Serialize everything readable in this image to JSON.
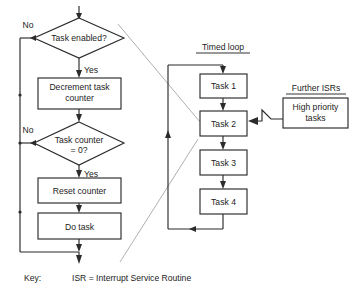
{
  "diagram": {
    "type": "flowchart",
    "colors": {
      "background": "#ffffff",
      "stroke": "#2b2b2b",
      "text": "#1c1c1c",
      "guide_line": "#9a9a9a"
    },
    "left_branch": {
      "decisions": [
        {
          "id": "task-enabled",
          "label": "Task enabled?"
        },
        {
          "id": "task-counter-zero",
          "label_line1": "Task counter",
          "label_line2": "= 0?"
        }
      ],
      "processes": [
        {
          "id": "decrement-task-counter",
          "label_line1": "Decrement task",
          "label_line2": "counter"
        },
        {
          "id": "reset-counter",
          "label": "Reset counter"
        },
        {
          "id": "do-task",
          "label": "Do task"
        }
      ],
      "edge_labels": {
        "no_1": "No",
        "yes_1": "Yes",
        "no_2": "No",
        "yes_2": "Yes"
      }
    },
    "timed_loop": {
      "title": "Timed loop",
      "tasks": [
        {
          "id": "task-1",
          "label": "Task 1"
        },
        {
          "id": "task-2",
          "label": "Task 2"
        },
        {
          "id": "task-3",
          "label": "Task 3"
        },
        {
          "id": "task-4",
          "label": "Task 4"
        }
      ]
    },
    "further_isrs": {
      "title": "Further ISRs",
      "box": {
        "id": "high-priority-tasks",
        "label_line1": "High priority",
        "label_line2": "tasks"
      }
    },
    "key": {
      "label": "Key:",
      "definition": "ISR = Interrupt Service Routine"
    }
  }
}
